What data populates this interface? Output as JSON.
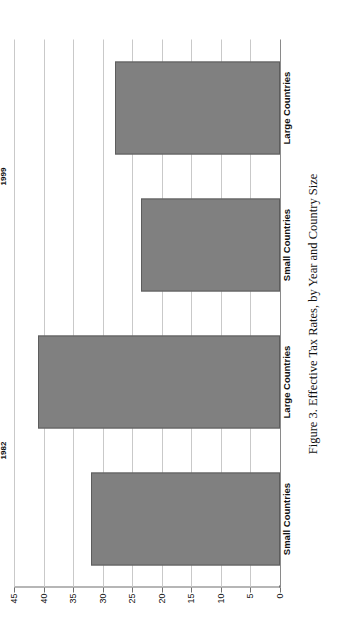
{
  "figure": {
    "caption": "Figure 3.  Effective Tax Rates, by Year and Country Size",
    "bar_color": "#808080",
    "bar_border_color": "#5d5d5d",
    "grid_color": "#c9c9c9",
    "axis_color": "#6f6f6f"
  },
  "chart_data": {
    "type": "bar",
    "title": "Figure 3.  Effective Tax Rates, by Year and Country Size",
    "orientation": "vertical",
    "xlabel": "",
    "ylabel": "",
    "ylim": [
      0,
      45
    ],
    "grid": true,
    "legend": "none",
    "categories": [
      "Small Countries",
      "Large Countries",
      "Small Countries",
      "Large Countries"
    ],
    "groups": [
      {
        "label": "1982",
        "categories": [
          "Small Countries",
          "Large Countries"
        ],
        "values": [
          32,
          41
        ]
      },
      {
        "label": "1999",
        "categories": [
          "Small Countries",
          "Large Countries"
        ],
        "values": [
          23.5,
          28
        ]
      }
    ],
    "values": [
      32,
      41,
      23.5,
      28
    ],
    "yticks": [
      45,
      40,
      35,
      30,
      25,
      20,
      15,
      10,
      5,
      0
    ],
    "ytick_labels": [
      "45",
      "40",
      "35",
      "30",
      "25",
      "20",
      "15",
      "10",
      "5",
      "0"
    ],
    "bars": [
      {
        "group": "1982",
        "category": "Small Countries",
        "value": 32
      },
      {
        "group": "1982",
        "category": "Large Countries",
        "value": 41
      },
      {
        "group": "1999",
        "category": "Small Countries",
        "value": 23.5
      },
      {
        "group": "1999",
        "category": "Large Countries",
        "value": 28
      }
    ]
  }
}
